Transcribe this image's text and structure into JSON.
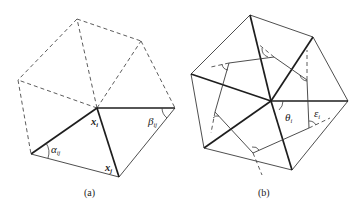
{
  "figure": {
    "panel_a": {
      "caption": "(a)",
      "labels": {
        "xi": {
          "base": "x",
          "sub": "i"
        },
        "xj": {
          "base": "x",
          "sub": "j"
        },
        "alpha": {
          "base": "α",
          "sub": "ij"
        },
        "beta": {
          "base": "β",
          "sub": "ij"
        }
      }
    },
    "panel_b": {
      "caption": "(b)",
      "labels": {
        "theta": {
          "base": "θ",
          "sub": "i"
        },
        "epsilon": {
          "base": "ε",
          "sub": "i"
        }
      }
    },
    "colors": {
      "line": "#1e1e1e",
      "background": "#ffffff"
    }
  }
}
